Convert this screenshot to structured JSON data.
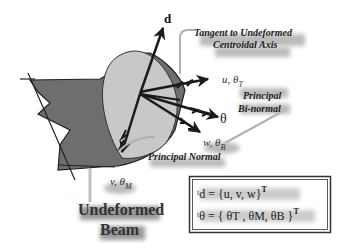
{
  "labels": {
    "d_vector": "d",
    "tangent_line1": "Tangent to Undeformed",
    "tangent_line2": "Centroidal Axis",
    "u_theta_T": "u, θ",
    "u_theta_T_sub": "T",
    "principal_binormal_line1": "Principal",
    "principal_binormal_line2": "Bi-normal",
    "theta_vector": "θ",
    "w_theta_B": "w, θ",
    "w_theta_B_sub": "B",
    "principal_normal": "Principal Normal",
    "v_theta_M": "v, θ",
    "v_theta_M_sub": "M",
    "undeformed_line1": "Undeformed",
    "undeformed_line2": "Beam"
  },
  "equations": {
    "d_eq": "ᵗd = {u,  v,  w}",
    "d_eq_sup": "T",
    "theta_eq": "ᵗθ = { θT , θM, θB }",
    "theta_eq_sup": "T"
  },
  "colors": {
    "beam_dark": "#6e6e6e",
    "beam_face": "#c8c8c8",
    "arrow": "#1a1a1a",
    "leader": "#b0b0b0",
    "box_border": "#333333"
  }
}
